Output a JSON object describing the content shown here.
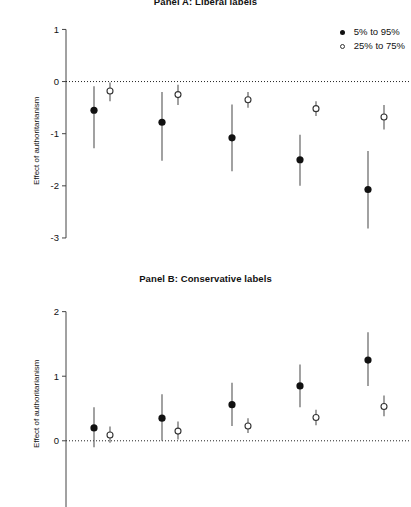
{
  "legend": {
    "position": "top-right",
    "entries": [
      {
        "label": "5% to 95%",
        "marker": "filled-circle"
      },
      {
        "label": "25% to 75%",
        "marker": "open-circle"
      }
    ]
  },
  "chart_data": [
    {
      "type": "scatter",
      "title": "Panel A: Liberal labels",
      "xlabel": "",
      "ylabel": "Effect of authoritarianism",
      "ylim": [
        -3.25,
        1.2
      ],
      "yticks": [
        1,
        0,
        -1,
        -2,
        -3
      ],
      "ytick_labels": [
        "1",
        "0",
        "-1",
        "-2",
        "-3"
      ],
      "grid": false,
      "zero_reference_line": 0,
      "zero_line_style": "dotted",
      "series": [
        {
          "name": "5% to 95%",
          "marker": "filled-circle",
          "x": [
            1,
            2,
            3,
            4,
            5
          ],
          "values": [
            -0.55,
            -0.78,
            -1.08,
            -1.5,
            -2.07
          ],
          "lower": [
            -1.28,
            -1.52,
            -1.72,
            -2.0,
            -2.82
          ],
          "upper": [
            -0.09,
            -0.2,
            -0.44,
            -1.02,
            -1.33
          ]
        },
        {
          "name": "25% to 75%",
          "marker": "open-circle",
          "x": [
            1,
            2,
            3,
            4,
            5
          ],
          "values": [
            -0.18,
            -0.25,
            -0.35,
            -0.52,
            -0.68
          ],
          "lower": [
            -0.38,
            -0.45,
            -0.5,
            -0.66,
            -0.92
          ],
          "upper": [
            -0.02,
            -0.06,
            -0.2,
            -0.38,
            -0.45
          ]
        }
      ]
    },
    {
      "type": "scatter",
      "title": "Panel B: Conservative labels",
      "xlabel": "",
      "ylabel": "Effect of authoritarianism",
      "ylim": [
        -0.22,
        2.18
      ],
      "yticks": [
        2,
        1,
        0
      ],
      "ytick_labels": [
        "2",
        "1",
        "0"
      ],
      "grid": false,
      "zero_reference_line": 0,
      "zero_line_style": "dotted",
      "series": [
        {
          "name": "5% to 95%",
          "marker": "filled-circle",
          "x": [
            1,
            2,
            3,
            4,
            5
          ],
          "values": [
            0.2,
            0.35,
            0.56,
            0.85,
            1.25
          ],
          "lower": [
            -0.1,
            0.0,
            0.23,
            0.52,
            0.85
          ],
          "upper": [
            0.52,
            0.72,
            0.9,
            1.18,
            1.68
          ]
        },
        {
          "name": "25% to 75%",
          "marker": "open-circle",
          "x": [
            1,
            2,
            3,
            4,
            5
          ],
          "values": [
            0.09,
            0.15,
            0.23,
            0.36,
            0.53
          ],
          "lower": [
            -0.03,
            0.02,
            0.12,
            0.24,
            0.38
          ],
          "upper": [
            0.22,
            0.3,
            0.35,
            0.48,
            0.7
          ]
        }
      ]
    }
  ]
}
